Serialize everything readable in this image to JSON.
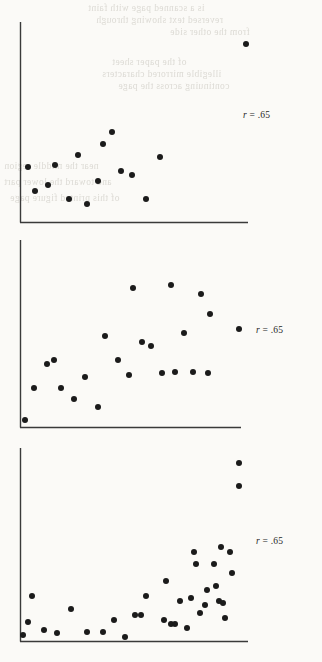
{
  "page": {
    "background_color": "#fbfaf7",
    "width": 322,
    "height": 662,
    "bleed_through_lines": [
      "is a scanned page with faint",
      "reversed text showing through",
      "from the other side",
      "of the paper sheet",
      "illegible mirrored characters",
      "continuing across the page",
      "near the middle region",
      "and toward the lower part",
      "of this printed figure page"
    ]
  },
  "charts": [
    {
      "id": "scatterplot-top",
      "annotation": "r = .65",
      "annotation_symbol": "r",
      "annotation_value": ".65",
      "chart_data": {
        "type": "scatter",
        "title": "",
        "xlabel": "",
        "ylabel": "",
        "xlim": [
          0,
          100
        ],
        "ylim": [
          0,
          100
        ],
        "grid": false,
        "legend": "none",
        "annotations": [
          "r = .65"
        ],
        "series": [
          {
            "name": "observations",
            "points": [
              [
                3,
                28
              ],
              [
                6,
                16
              ],
              [
                12,
                19
              ],
              [
                15,
                29
              ],
              [
                21,
                12
              ],
              [
                25,
                34
              ],
              [
                29,
                9
              ],
              [
                34,
                21
              ],
              [
                36,
                40
              ],
              [
                40,
                46
              ],
              [
                44,
                26
              ],
              [
                49,
                24
              ],
              [
                55,
                12
              ],
              [
                61,
                33
              ],
              [
                99,
                91
              ]
            ]
          }
        ]
      }
    },
    {
      "id": "scatterplot-middle",
      "annotation": "r = .65",
      "annotation_symbol": "r",
      "annotation_value": ".65",
      "chart_data": {
        "type": "scatter",
        "title": "",
        "xlabel": "",
        "ylabel": "",
        "xlim": [
          0,
          100
        ],
        "ylim": [
          0,
          100
        ],
        "grid": false,
        "legend": "none",
        "annotations": [
          "r = .65"
        ],
        "series": [
          {
            "name": "observations",
            "points": [
              [
                2,
                4
              ],
              [
                6,
                21
              ],
              [
                12,
                34
              ],
              [
                15,
                36
              ],
              [
                18,
                21
              ],
              [
                24,
                15
              ],
              [
                29,
                27
              ],
              [
                35,
                11
              ],
              [
                38,
                49
              ],
              [
                44,
                36
              ],
              [
                49,
                28
              ],
              [
                51,
                75
              ],
              [
                55,
                46
              ],
              [
                59,
                44
              ],
              [
                64,
                29
              ],
              [
                68,
                77
              ],
              [
                70,
                30
              ],
              [
                74,
                51
              ],
              [
                78,
                30
              ],
              [
                82,
                72
              ],
              [
                85,
                29
              ],
              [
                86,
                61
              ],
              [
                99,
                53
              ]
            ]
          }
        ]
      }
    },
    {
      "id": "scatterplot-bottom",
      "annotation": "r = .65",
      "annotation_symbol": "r",
      "annotation_value": ".65",
      "chart_data": {
        "type": "scatter",
        "title": "",
        "xlabel": "",
        "ylabel": "",
        "xlim": [
          0,
          100
        ],
        "ylim": [
          0,
          100
        ],
        "grid": false,
        "legend": "none",
        "annotations": [
          "r = .65"
        ],
        "series": [
          {
            "name": "observations",
            "points": [
              [
                1,
                3
              ],
              [
                3,
                10
              ],
              [
                5,
                24
              ],
              [
                10,
                6
              ],
              [
                16,
                4
              ],
              [
                22,
                17
              ],
              [
                29,
                5
              ],
              [
                36,
                5
              ],
              [
                41,
                11
              ],
              [
                46,
                2
              ],
              [
                50,
                14
              ],
              [
                53,
                14
              ],
              [
                55,
                24
              ],
              [
                63,
                11
              ],
              [
                64,
                32
              ],
              [
                66,
                9
              ],
              [
                68,
                9
              ],
              [
                70,
                21
              ],
              [
                73,
                7
              ],
              [
                75,
                23
              ],
              [
                76,
                47
              ],
              [
                77,
                41
              ],
              [
                79,
                15
              ],
              [
                81,
                19
              ],
              [
                82,
                27
              ],
              [
                85,
                41
              ],
              [
                86,
                29
              ],
              [
                87,
                21
              ],
              [
                88,
                50
              ],
              [
                89,
                20
              ],
              [
                90,
                12
              ],
              [
                92,
                47
              ],
              [
                93,
                36
              ],
              [
                96,
                94
              ],
              [
                96,
                82
              ]
            ]
          }
        ]
      }
    }
  ]
}
